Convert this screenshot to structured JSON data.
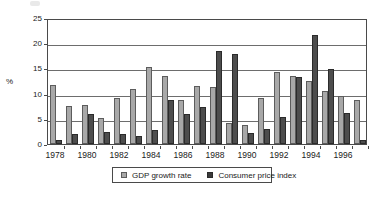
{
  "chart_data": {
    "type": "bar",
    "title": "",
    "xlabel": "",
    "ylabel": "%",
    "ylim": [
      0,
      25
    ],
    "yticks": [
      0,
      5,
      10,
      15,
      20,
      25
    ],
    "grid": true,
    "legend_position": "bottom",
    "categories": [
      "1978",
      "1979",
      "1980",
      "1981",
      "1982",
      "1983",
      "1984",
      "1985",
      "1986",
      "1987",
      "1988",
      "1989",
      "1990",
      "1991",
      "1992",
      "1993",
      "1994",
      "1995",
      "1996",
      "1997"
    ],
    "xtick_labels": [
      "1978",
      "1980",
      "1982",
      "1984",
      "1986",
      "1988",
      "1990",
      "1992",
      "1994",
      "1996"
    ],
    "series": [
      {
        "name": "GDP growth rate",
        "color": "#a8a8a8",
        "values": [
          11.7,
          7.6,
          7.8,
          5.2,
          9.1,
          10.9,
          15.2,
          13.5,
          8.8,
          11.6,
          11.3,
          4.1,
          3.8,
          9.2,
          14.2,
          13.5,
          12.6,
          10.5,
          9.6,
          8.8
        ]
      },
      {
        "name": "Consumer price index",
        "color": "#4d4d4d",
        "values": [
          0.7,
          1.9,
          6.0,
          2.4,
          1.9,
          1.5,
          2.8,
          8.8,
          6.0,
          7.3,
          18.5,
          17.8,
          2.1,
          2.9,
          5.4,
          13.2,
          21.7,
          14.8,
          6.1,
          0.8
        ]
      }
    ]
  },
  "legend": {
    "gdp_label": "GDP growth rate",
    "cpi_label": "Consumer price index"
  }
}
